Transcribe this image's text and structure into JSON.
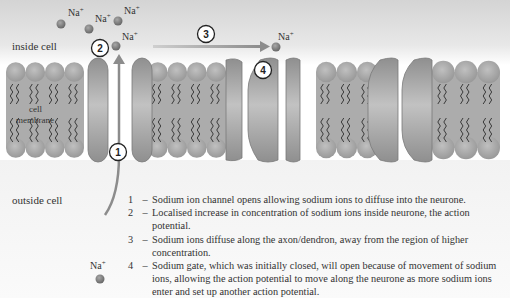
{
  "labels": {
    "inside": "inside cell",
    "outside": "outside cell",
    "membrane_line1": "cell",
    "membrane_line2": "membrane",
    "ion": "Na",
    "ion_charge": "+"
  },
  "markers": [
    "1",
    "2",
    "3",
    "4"
  ],
  "legend": [
    {
      "num": "1",
      "text": "Sodium ion channel opens allowing sodium ions to diffuse into the neurone."
    },
    {
      "num": "2",
      "text": "Localised increase in concentration of sodium ions inside neurone, the action potential."
    },
    {
      "num": "3",
      "text": "Sodium ions diffuse along the axon/dendron, away from the region of higher concentration."
    },
    {
      "num": "4",
      "text": "Sodium gate, which was initially closed, will open because of movement of sodium ions, allowing the action potential to move along the neurone as more sodium ions enter and set up another action potential."
    }
  ],
  "colors": {
    "background_top": "#d6d6d6",
    "membrane": "#a9a9a9",
    "head": "#a2a2a2",
    "protein": "#9a9a9a",
    "ion": "#808080",
    "arrow": "#8c8c8c",
    "text": "#333333"
  }
}
